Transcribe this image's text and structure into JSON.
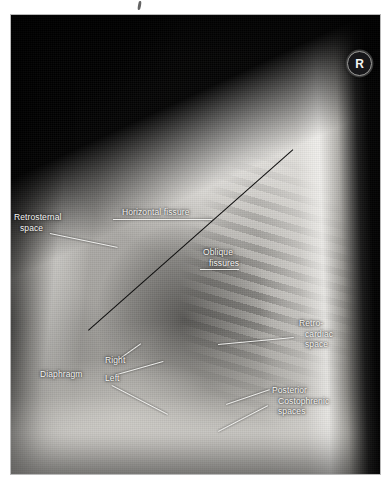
{
  "figure": {
    "modality": "chest-radiograph",
    "view": "lateral",
    "side_marker": "R",
    "panel": {
      "x": 11,
      "y": 15,
      "width": 369,
      "height": 459
    }
  },
  "colors": {
    "annotation_text": "#f6f6f4",
    "annotation_leader": "#f3f3f1",
    "fissure_line": "#0d0d0d",
    "marker_background": "#17171a",
    "marker_text": "#f4f4f2",
    "page_background": "#ffffff"
  },
  "annotations": [
    {
      "id": "retrosternal-space",
      "label_lines": [
        "Retrosternal",
        "space"
      ],
      "label": {
        "x": 14,
        "y": 212,
        "align": "left"
      },
      "leaders": [
        {
          "x1": 50,
          "y1": 233,
          "x2": 118,
          "y2": 247
        }
      ]
    },
    {
      "id": "horizontal-fissure",
      "label_lines": [
        "Horizontal fissure"
      ],
      "label": {
        "x": 122,
        "y": 207,
        "align": "left"
      },
      "leaders": [
        {
          "x1": 113,
          "y1": 219,
          "x2": 212,
          "y2": 219
        }
      ]
    },
    {
      "id": "oblique-fissures",
      "label_lines": [
        "Oblique",
        "fissures"
      ],
      "label": {
        "x": 203,
        "y": 247,
        "align": "left"
      },
      "leaders": [
        {
          "x1": 200,
          "y1": 269,
          "x2": 239,
          "y2": 269
        }
      ]
    },
    {
      "id": "retro-cardiac-space",
      "label_lines": [
        "Retro-",
        "cardiac",
        "space"
      ],
      "label": {
        "x": 299,
        "y": 318,
        "align": "left"
      },
      "leaders": [
        {
          "x1": 218,
          "y1": 344,
          "x2": 294,
          "y2": 337
        }
      ]
    },
    {
      "id": "diaphragm",
      "label_lines": [
        "Diaphragm"
      ],
      "label": {
        "x": 40,
        "y": 369,
        "align": "left"
      },
      "leaders": []
    },
    {
      "id": "diaphragm-right",
      "label_lines": [
        "Right"
      ],
      "label": {
        "x": 105,
        "y": 355,
        "align": "left"
      },
      "leaders": [
        {
          "x1": 117,
          "y1": 360,
          "x2": 141,
          "y2": 343
        }
      ]
    },
    {
      "id": "diaphragm-left",
      "label_lines": [
        "Left"
      ],
      "label": {
        "x": 105,
        "y": 373,
        "align": "left"
      },
      "leaders": [
        {
          "x1": 117,
          "y1": 374,
          "x2": 163,
          "y2": 361
        },
        {
          "x1": 112,
          "y1": 385,
          "x2": 168,
          "y2": 414
        }
      ]
    },
    {
      "id": "posterior-costophrenic-spaces",
      "label_lines": [
        "Posterior",
        "Costophrenic",
        "spaces"
      ],
      "label": {
        "x": 272,
        "y": 385,
        "align": "left"
      },
      "leaders": [
        {
          "x1": 226,
          "y1": 404,
          "x2": 270,
          "y2": 389
        },
        {
          "x1": 218,
          "y1": 431,
          "x2": 268,
          "y2": 405
        }
      ]
    }
  ],
  "fissure_lines": [
    {
      "id": "oblique-fissure-line",
      "x1": 88,
      "y1": 330,
      "x2": 293,
      "y2": 149
    }
  ]
}
